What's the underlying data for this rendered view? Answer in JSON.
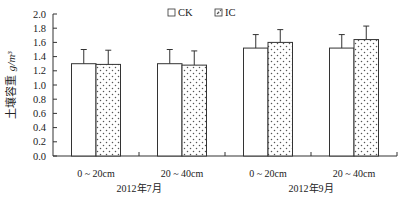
{
  "chart_data": {
    "type": "bar",
    "title": "",
    "xlabel": "",
    "ylabel": "土壤容重 g/m³",
    "ylim": [
      0,
      2.0
    ],
    "yticks": [
      0.0,
      0.2,
      0.4,
      0.6,
      0.8,
      1.0,
      1.2,
      1.4,
      1.6,
      1.8,
      2.0
    ],
    "ytick_labels": [
      "0.0",
      "0.2",
      "0.4",
      "0.6",
      "0.8",
      "1.0",
      "1.2",
      "1.4",
      "1.6",
      "1.8",
      "2.0"
    ],
    "grid": false,
    "legend_position": "top-center",
    "categories": [
      "0 ~ 20cm",
      "20 ~ 40cm",
      "0 ~ 20cm",
      "20 ~ 40cm"
    ],
    "category_groups": [
      {
        "label": "2012年7月",
        "categories": [
          0,
          1
        ]
      },
      {
        "label": "2012年9月",
        "categories": [
          2,
          3
        ]
      }
    ],
    "series": [
      {
        "name": "CK",
        "pattern": "empty",
        "values": [
          1.3,
          1.3,
          1.52,
          1.52
        ],
        "error": [
          0.2,
          0.2,
          0.19,
          0.19
        ]
      },
      {
        "name": "IC",
        "pattern": "dotted",
        "values": [
          1.29,
          1.28,
          1.6,
          1.64
        ],
        "error": [
          0.2,
          0.2,
          0.18,
          0.19
        ]
      }
    ]
  },
  "legend": {
    "items": [
      {
        "label": "CK"
      },
      {
        "label": "IC"
      }
    ]
  },
  "axis": {
    "ylabel_text": "土壤容重",
    "ylabel_unit": "g/m³"
  },
  "colors": {
    "bar_stroke": "#333333",
    "bar_fill": "#ffffff",
    "dot": "#555555",
    "axis": "#333333"
  }
}
